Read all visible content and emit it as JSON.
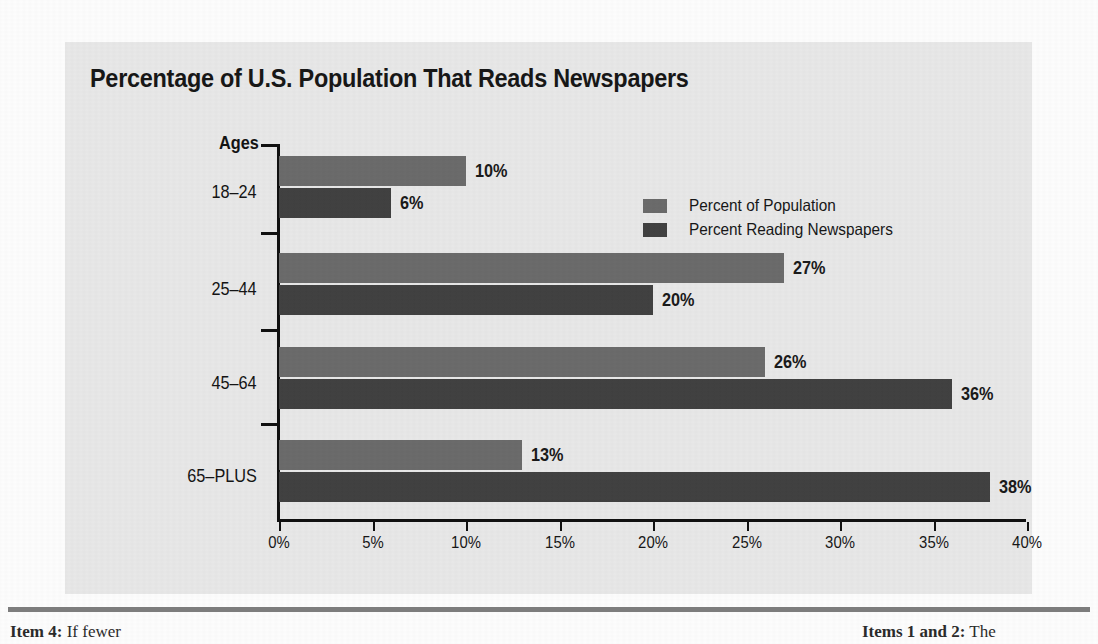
{
  "chart_data": {
    "type": "bar",
    "orientation": "horizontal",
    "title": "Percentage of U.S. Population That Reads Newspapers",
    "xlabel": "",
    "ylabel": "Ages",
    "categories": [
      "18–24",
      "25–44",
      "45–64",
      "65–PLUS"
    ],
    "series": [
      {
        "name": "Percent of Population",
        "color": "#6b6b6b",
        "values": [
          10,
          27,
          26,
          13
        ],
        "labels": [
          "10%",
          "27%",
          "26%",
          "13%"
        ]
      },
      {
        "name": "Percent Reading Newspapers",
        "color": "#414141",
        "values": [
          6,
          20,
          36,
          38
        ],
        "labels": [
          "6%",
          "20%",
          "36%",
          "38%"
        ]
      }
    ],
    "xlim": [
      0,
      40
    ],
    "xticks": [
      0,
      5,
      10,
      15,
      20,
      25,
      30,
      35,
      40
    ],
    "xticklabels": [
      "0%",
      "5%",
      "10%",
      "15%",
      "20%",
      "25%",
      "30%",
      "35%",
      "40%"
    ],
    "grid": false,
    "legend_position": "upper-right-inside"
  },
  "legend": {
    "items": [
      {
        "label": "Percent of Population",
        "color": "#6b6b6b"
      },
      {
        "label": "Percent Reading Newspapers",
        "color": "#414141"
      }
    ]
  },
  "footer": {
    "left_strong": "Item 4:",
    "left_rest": " If fewer",
    "right_strong": "Items 1 and 2:",
    "right_rest": " The"
  },
  "colors": {
    "panel_background": "#e8e8e8",
    "page_background": "#fdfdfd",
    "axis": "#111111",
    "text": "#171717",
    "series_population": "#6b6b6b",
    "series_reading": "#414141",
    "footer_rule": "#7d7d7d"
  }
}
